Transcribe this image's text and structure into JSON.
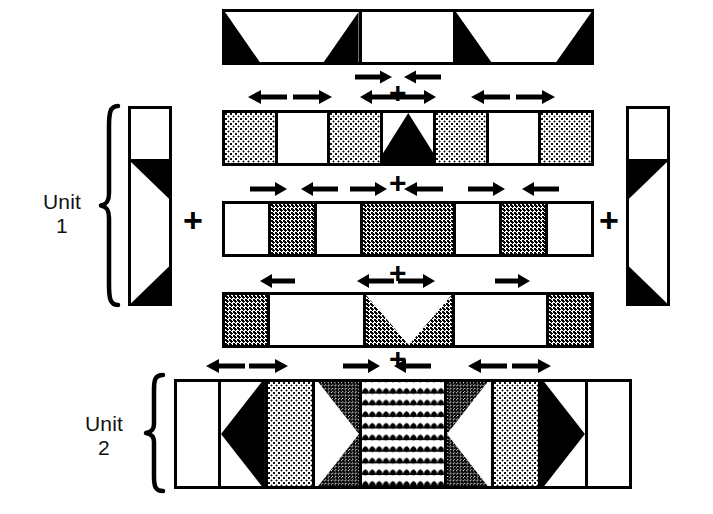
{
  "figure": {
    "background_color": "#ffffff",
    "ink_color": "#000000",
    "width": 713,
    "height": 514
  },
  "labels": [
    {
      "id": "unit-1",
      "line1": "Unit",
      "line2": "1"
    },
    {
      "id": "unit-2",
      "line1": "Unit",
      "line2": "2"
    }
  ],
  "operators": {
    "plus": "+",
    "plus_left_of_rows": "+",
    "plus_right_of_rows": "+"
  },
  "plus_signs": [
    {
      "id": "plus-top-band",
      "symbol": "+",
      "x": 397,
      "y": 68,
      "size": 26
    },
    {
      "id": "plus-row2",
      "symbol": "+",
      "x": 397,
      "y": 80,
      "size": 26
    },
    {
      "id": "plus-row3",
      "symbol": "+",
      "x": 397,
      "y": 172,
      "size": 26
    },
    {
      "id": "plus-row4",
      "symbol": "+",
      "x": 397,
      "y": 262,
      "size": 26
    },
    {
      "id": "plus-unit2",
      "symbol": "+",
      "x": 397,
      "y": 348,
      "size": 26
    },
    {
      "id": "plus-left-join",
      "symbol": "+",
      "x": 188,
      "y": 205,
      "size": 30
    },
    {
      "id": "plus-right-join",
      "symbol": "+",
      "x": 604,
      "y": 205,
      "size": 30
    }
  ],
  "brackets": [
    {
      "id": "brace-unit-1",
      "label_ref": "unit-1",
      "x": 98,
      "y": 103,
      "width": 22,
      "height": 205
    },
    {
      "id": "brace-unit-2",
      "label_ref": "unit-2",
      "x": 143,
      "y": 372,
      "width": 22,
      "height": 122
    }
  ],
  "bands": [
    {
      "id": "band-top",
      "name": "top-band",
      "x": 222,
      "y": 9,
      "width": 372,
      "height": 56,
      "cells": [
        {
          "fill": "white",
          "motif": "trapezoid-black-corners",
          "flex": 138
        },
        {
          "fill": "white",
          "motif": "plain",
          "flex": 94
        },
        {
          "fill": "white",
          "motif": "trapezoid-black-corners",
          "flex": 140
        }
      ]
    },
    {
      "id": "band-row-2",
      "name": "second-band",
      "x": 222,
      "y": 110,
      "width": 372,
      "height": 56,
      "cells": [
        {
          "fill": "dot-light",
          "motif": "plain",
          "flex": 53
        },
        {
          "fill": "white",
          "motif": "plain",
          "flex": 53
        },
        {
          "fill": "dot-light",
          "motif": "plain",
          "flex": 53
        },
        {
          "fill": "white",
          "motif": "triangle-up-black",
          "flex": 54
        },
        {
          "fill": "dot-light",
          "motif": "plain",
          "flex": 53
        },
        {
          "fill": "white",
          "motif": "plain",
          "flex": 53
        },
        {
          "fill": "dot-light",
          "motif": "plain",
          "flex": 53
        }
      ]
    },
    {
      "id": "band-row-3",
      "name": "third-band",
      "x": 222,
      "y": 201,
      "width": 372,
      "height": 56,
      "cells": [
        {
          "fill": "white",
          "motif": "plain",
          "flex": 46
        },
        {
          "fill": "dot-med",
          "motif": "plain",
          "flex": 46
        },
        {
          "fill": "white",
          "motif": "plain",
          "flex": 46
        },
        {
          "fill": "dot-med",
          "motif": "plain",
          "flex": 96
        },
        {
          "fill": "white",
          "motif": "plain",
          "flex": 46
        },
        {
          "fill": "dot-med",
          "motif": "plain",
          "flex": 46
        },
        {
          "fill": "white",
          "motif": "plain",
          "flex": 46
        }
      ]
    },
    {
      "id": "band-row-4",
      "name": "fourth-band",
      "x": 222,
      "y": 292,
      "width": 372,
      "height": 56,
      "cells": [
        {
          "fill": "dot-med",
          "motif": "plain",
          "flex": 44
        },
        {
          "fill": "white",
          "motif": "plain",
          "flex": 98
        },
        {
          "fill": "dot-med",
          "motif": "vee-white",
          "flex": 90
        },
        {
          "fill": "white",
          "motif": "plain",
          "flex": 96
        },
        {
          "fill": "dot-med",
          "motif": "plain",
          "flex": 44
        }
      ]
    },
    {
      "id": "band-unit-2",
      "name": "unit-2-band",
      "x": 174,
      "y": 379,
      "width": 458,
      "height": 110,
      "cells": [
        {
          "fill": "white",
          "motif": "plain",
          "flex": 44
        },
        {
          "fill": "white",
          "motif": "triangle-left-black",
          "flex": 47
        },
        {
          "fill": "dot-light",
          "motif": "plain",
          "flex": 47
        },
        {
          "fill": "dot-dark",
          "motif": "triangle-right-white",
          "flex": 47
        },
        {
          "fill": "scale",
          "motif": "plain",
          "flex": 88
        },
        {
          "fill": "dot-dark",
          "motif": "triangle-left-white",
          "flex": 47
        },
        {
          "fill": "dot-light",
          "motif": "plain",
          "flex": 47
        },
        {
          "fill": "white",
          "motif": "triangle-right-black",
          "flex": 47
        },
        {
          "fill": "white",
          "motif": "plain",
          "flex": 44
        }
      ]
    }
  ],
  "side_panels": [
    {
      "id": "panel-left",
      "name": "left-vertical-panel",
      "x": 128,
      "y": 106,
      "width": 44,
      "height": 200,
      "cells": [
        {
          "fill": "white",
          "motif": "plain",
          "flex": 52
        },
        {
          "fill": "white",
          "motif": "trapezoid-black-right",
          "flex": 148
        }
      ]
    },
    {
      "id": "panel-right",
      "name": "right-vertical-panel",
      "x": 626,
      "y": 106,
      "width": 44,
      "height": 200,
      "cells": [
        {
          "fill": "white",
          "motif": "plain",
          "flex": 52
        },
        {
          "fill": "white",
          "motif": "trapezoid-black-left",
          "flex": 148
        }
      ]
    }
  ],
  "arrow_groups": [
    {
      "id": "arrows-under-top-band",
      "y": 68,
      "arrows": [
        {
          "dir": "right",
          "x": 358,
          "length": 36
        },
        {
          "dir": "left",
          "x": 404,
          "length": 36
        }
      ]
    },
    {
      "id": "arrows-row-2",
      "y": 88,
      "arrows": [
        {
          "dir": "left",
          "x": 250,
          "length": 38
        },
        {
          "dir": "right",
          "x": 294,
          "length": 38
        },
        {
          "dir": "left",
          "x": 363,
          "length": 34
        },
        {
          "dir": "right",
          "x": 400,
          "length": 34
        },
        {
          "dir": "left",
          "x": 473,
          "length": 38
        },
        {
          "dir": "right",
          "x": 517,
          "length": 38
        }
      ]
    },
    {
      "id": "arrows-row-3",
      "y": 180,
      "arrows": [
        {
          "dir": "right",
          "x": 252,
          "length": 36
        },
        {
          "dir": "left",
          "x": 302,
          "length": 36
        },
        {
          "dir": "right",
          "x": 352,
          "length": 36
        },
        {
          "dir": "left",
          "x": 404,
          "length": 38
        },
        {
          "dir": "right",
          "x": 470,
          "length": 36
        },
        {
          "dir": "left",
          "x": 523,
          "length": 36
        }
      ]
    },
    {
      "id": "arrows-row-4",
      "y": 272,
      "arrows": [
        {
          "dir": "left",
          "x": 262,
          "length": 32
        },
        {
          "dir": "left",
          "x": 359,
          "length": 36
        },
        {
          "dir": "right",
          "x": 399,
          "length": 36
        },
        {
          "dir": "right",
          "x": 497,
          "length": 34
        }
      ]
    },
    {
      "id": "arrows-unit-2",
      "y": 357,
      "arrows": [
        {
          "dir": "left",
          "x": 208,
          "length": 38
        },
        {
          "dir": "right",
          "x": 250,
          "length": 38
        },
        {
          "dir": "right",
          "x": 345,
          "length": 36
        },
        {
          "dir": "left",
          "x": 395,
          "length": 36
        },
        {
          "dir": "left",
          "x": 470,
          "length": 38
        },
        {
          "dir": "right",
          "x": 513,
          "length": 38
        }
      ]
    }
  ]
}
